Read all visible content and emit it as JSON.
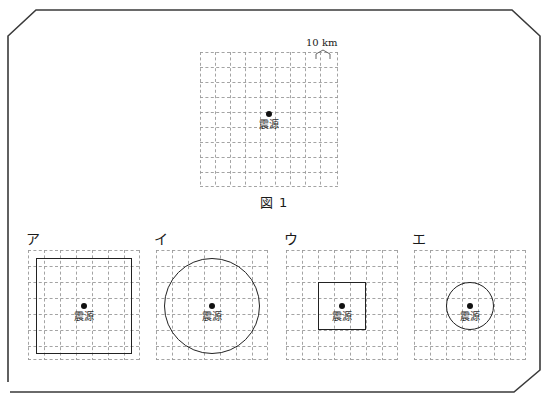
{
  "figure1": {
    "caption": "図 1",
    "scale_label": "10 km",
    "epicenter_label": "震源",
    "grid": {
      "cols": 9,
      "rows": 9,
      "cell_px": 15
    }
  },
  "options": [
    {
      "label": "ア",
      "epicenter_label": "震源",
      "shape": "square",
      "shape_size_cells": 6,
      "shape_kind_name": "large-square"
    },
    {
      "label": "イ",
      "epicenter_label": "震源",
      "shape": "circle",
      "shape_size_cells": 6,
      "shape_kind_name": "large-circle"
    },
    {
      "label": "ウ",
      "epicenter_label": "震源",
      "shape": "square",
      "shape_size_cells": 3,
      "shape_kind_name": "small-square"
    },
    {
      "label": "エ",
      "epicenter_label": "震源",
      "shape": "circle",
      "shape_size_cells": 3,
      "shape_kind_name": "small-circle"
    }
  ],
  "option_grid": {
    "cols": 7,
    "rows": 7,
    "cell_px": 16
  },
  "footer_note": "",
  "colors": {
    "ink": "#1a1a1a",
    "grid_line": "#9a9a9a",
    "shape_line": "#222222",
    "frame": "#3a3a3a"
  }
}
